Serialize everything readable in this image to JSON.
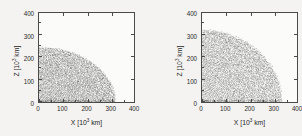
{
  "figure": {
    "kind": "two-panel-scatter",
    "background_color": "#f4f3f1",
    "frame_color": "#4a4a4a",
    "particle_color": "#4d4d4d"
  },
  "panels": [
    {
      "id": "left",
      "xlabel_text": "X [10",
      "xlabel_exp": "3",
      "xlabel_unit": " km]",
      "ylabel_text": "Z [10",
      "ylabel_exp": "3",
      "ylabel_unit": " km]"
    },
    {
      "id": "right",
      "xlabel_text": "X [10",
      "xlabel_exp": "3",
      "xlabel_unit": " km]",
      "ylabel_text": "Z [10",
      "ylabel_exp": "3",
      "ylabel_unit": " km]"
    }
  ],
  "ticks": {
    "x": [
      "0",
      "100",
      "200",
      "300",
      "400"
    ],
    "y": [
      "0",
      "100",
      "200",
      "300",
      "400"
    ]
  },
  "chart_data": [
    {
      "type": "scatter",
      "panel": "left",
      "title": "",
      "xlabel": "X [10^3 km]",
      "ylabel": "Z [10^3 km]",
      "xlim": [
        0,
        400
      ],
      "ylim": [
        0,
        400
      ],
      "xticks": [
        0,
        100,
        200,
        300,
        400
      ],
      "yticks": [
        0,
        100,
        200,
        300,
        400
      ],
      "grid": false,
      "legend": "none",
      "description": "Meridional cross-section of SPH particle distribution for an oblate body; quadrant X>=0, Z>=0. Particle cloud fills an oblate quarter-ellipse shape with a sharp outer boundary and concentric radial shell structure, densest near the equatorial plane and origin.",
      "shape": "oblate-quarter-ellipse",
      "equatorial_radius": 320,
      "polar_radius": 245,
      "flattening": 0.234,
      "x_extent": [
        0,
        320
      ],
      "z_extent": [
        0,
        245
      ],
      "boundary_points": [
        {
          "x": 0,
          "z": 245
        },
        {
          "x": 50,
          "z": 243
        },
        {
          "x": 100,
          "z": 237
        },
        {
          "x": 150,
          "z": 226
        },
        {
          "x": 200,
          "z": 208
        },
        {
          "x": 240,
          "z": 188
        },
        {
          "x": 275,
          "z": 158
        },
        {
          "x": 300,
          "z": 120
        },
        {
          "x": 313,
          "z": 80
        },
        {
          "x": 319,
          "z": 40
        },
        {
          "x": 320,
          "z": 0
        }
      ],
      "n_particles_approx": 9000
    },
    {
      "type": "scatter",
      "panel": "right",
      "title": "",
      "xlabel": "X [10^3 km]",
      "ylabel": "Z [10^3 km]",
      "xlim": [
        0,
        400
      ],
      "ylim": [
        0,
        400
      ],
      "xticks": [
        0,
        100,
        200,
        300,
        400
      ],
      "yticks": [
        0,
        100,
        200,
        300,
        400
      ],
      "grid": false,
      "legend": "none",
      "description": "Meridional cross-section of SPH particle distribution for a less-flattened, larger body; quadrant X>=0, Z>=0. Particle cloud fills a nearly circular quarter-disc with sharp outer boundary and concentric radial shell structure.",
      "shape": "near-spherical-quarter-disc",
      "equatorial_radius": 335,
      "polar_radius": 322,
      "flattening": 0.039,
      "x_extent": [
        0,
        335
      ],
      "z_extent": [
        0,
        322
      ],
      "boundary_points": [
        {
          "x": 0,
          "z": 322
        },
        {
          "x": 50,
          "z": 319
        },
        {
          "x": 100,
          "z": 311
        },
        {
          "x": 150,
          "z": 297
        },
        {
          "x": 200,
          "z": 275
        },
        {
          "x": 240,
          "z": 252
        },
        {
          "x": 275,
          "z": 220
        },
        {
          "x": 300,
          "z": 185
        },
        {
          "x": 320,
          "z": 135
        },
        {
          "x": 332,
          "z": 70
        },
        {
          "x": 335,
          "z": 0
        }
      ],
      "n_particles_approx": 11000
    }
  ]
}
